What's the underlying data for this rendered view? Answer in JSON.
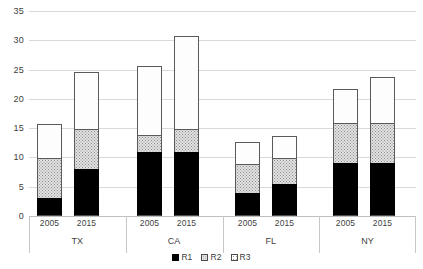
{
  "chart_data": {
    "type": "bar",
    "stacked": true,
    "title": "",
    "xlabel": "",
    "ylabel": "",
    "ylim": [
      0,
      35
    ],
    "ytick_step": 5,
    "yticks": [
      "0",
      "5",
      "10",
      "15",
      "20",
      "25",
      "30",
      "35"
    ],
    "grid": true,
    "legend_position": "bottom",
    "groups": [
      "TX",
      "CA",
      "FL",
      "NY"
    ],
    "subcategories": [
      "2005",
      "2015"
    ],
    "categories": [
      "TX 2005",
      "TX 2015",
      "CA 2005",
      "CA 2015",
      "FL 2005",
      "FL 2015",
      "NY 2005",
      "NY 2015"
    ],
    "series": [
      {
        "name": "R1",
        "color": "#000000",
        "values": [
          3,
          8,
          11,
          11,
          4,
          5.5,
          9,
          9
        ]
      },
      {
        "name": "R2",
        "color": "#e2e2e2",
        "values": [
          7,
          7,
          3,
          4,
          5,
          4.5,
          7,
          7
        ]
      },
      {
        "name": "R3",
        "color": "#fdfdfd",
        "values": [
          6,
          10,
          12,
          16,
          4,
          4,
          6,
          8
        ]
      }
    ],
    "totals": [
      16,
      25,
      26,
      31,
      13,
      14,
      22,
      24
    ]
  },
  "axis": {
    "y_ticks": [
      {
        "label": "35",
        "value": 35
      },
      {
        "label": "30",
        "value": 30
      },
      {
        "label": "25",
        "value": 25
      },
      {
        "label": "20",
        "value": 20
      },
      {
        "label": "15",
        "value": 15
      },
      {
        "label": "10",
        "value": 10
      },
      {
        "label": "5",
        "value": 5
      },
      {
        "label": "0",
        "value": 0
      }
    ],
    "groups": [
      {
        "label": "TX",
        "years": [
          "2005",
          "2015"
        ]
      },
      {
        "label": "CA",
        "years": [
          "2005",
          "2015"
        ]
      },
      {
        "label": "FL",
        "years": [
          "2005",
          "2015"
        ]
      },
      {
        "label": "NY",
        "years": [
          "2005",
          "2015"
        ]
      }
    ]
  },
  "legend": {
    "items": [
      {
        "label": "R1",
        "swatch": "r1"
      },
      {
        "label": "R2",
        "swatch": "r2"
      },
      {
        "label": "R3",
        "swatch": "r3"
      }
    ]
  }
}
